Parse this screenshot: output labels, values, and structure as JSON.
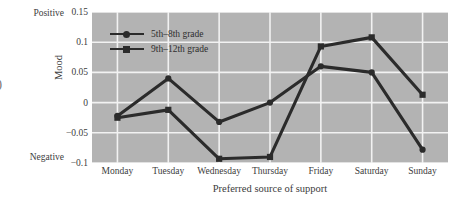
{
  "figure": {
    "edge_glyph": ")",
    "plot_background_color": "#b3b3b3",
    "grid_color": "#f2f2f2",
    "line_color": "#2b2b2b"
  },
  "axes": {
    "ylabel": "Mood",
    "xlabel": "Preferred source of support",
    "positive_label": "Positive",
    "negative_label": "Negative",
    "ytick_labels": [
      "0.15",
      "0.1",
      "0.05",
      "0",
      "-0.05",
      "-0.1"
    ],
    "ytick_values": [
      0.15,
      0.1,
      0.05,
      0,
      -0.05,
      -0.1
    ]
  },
  "legend": {
    "items": [
      {
        "label": "5th–8th grade",
        "marker": "circle"
      },
      {
        "label": "9th–12th grade",
        "marker": "square"
      }
    ]
  },
  "chart_data": {
    "type": "line",
    "title": "",
    "xlabel": "Preferred source of support",
    "ylabel": "Mood",
    "ylim": [
      -0.1,
      0.15
    ],
    "yticks": [
      -0.1,
      -0.05,
      0,
      0.05,
      0.1,
      0.15
    ],
    "grid": true,
    "legend_position": "upper-left-inside",
    "categories": [
      "Monday",
      "Tuesday",
      "Wednesday",
      "Thursday",
      "Friday",
      "Saturday",
      "Sunday"
    ],
    "series": [
      {
        "name": "5th–8th grade",
        "marker": "circle",
        "color": "#2b2b2b",
        "values": [
          -0.022,
          0.04,
          -0.032,
          0.0,
          0.06,
          0.05,
          -0.078
        ]
      },
      {
        "name": "9th–12th grade",
        "marker": "square",
        "color": "#2b2b2b",
        "values": [
          -0.025,
          -0.012,
          -0.093,
          -0.09,
          0.093,
          0.108,
          0.013
        ]
      }
    ],
    "annotations": [
      {
        "text": "Positive",
        "position": "y-axis-top"
      },
      {
        "text": "Negative",
        "position": "y-axis-bottom"
      }
    ]
  }
}
